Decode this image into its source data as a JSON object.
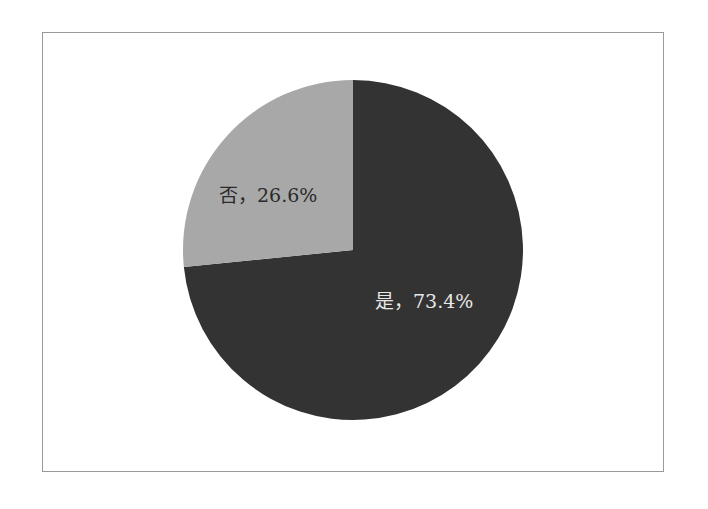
{
  "chart_data": {
    "type": "pie",
    "title": "",
    "categories": [
      "是",
      "否"
    ],
    "values": [
      73.4,
      26.6
    ],
    "unit": "%",
    "colors": [
      "#333333",
      "#a8a8a8"
    ],
    "labels": [
      "是，73.4%",
      "否，26.6%"
    ],
    "start_angle": "12 o'clock, clockwise",
    "legend": "none (inline data labels)"
  },
  "labels": {
    "yes": "是，73.4%",
    "no": "否，26.6%"
  }
}
